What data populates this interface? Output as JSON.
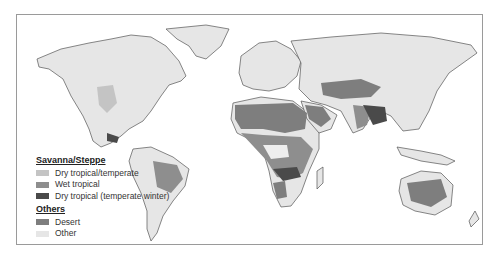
{
  "map": {
    "type": "World map of savanna/steppe vegetation zones (grayscale)"
  },
  "legend": {
    "group1_title": "Savanna/Steppe",
    "group1_items": [
      {
        "label": "Dry tropical/temperate",
        "color": "#c4c4c4"
      },
      {
        "label": "Wet tropical",
        "color": "#8e8e8e"
      },
      {
        "label": "Dry tropical (temperate winter)",
        "color": "#4a4a4a"
      }
    ],
    "group2_title": "Others",
    "group2_items": [
      {
        "label": "Desert",
        "color": "#7e7e7e"
      },
      {
        "label": "Other",
        "color": "#e6e6e6"
      }
    ]
  },
  "colors": {
    "other": "#e6e6e6",
    "dry_tropical_temperate": "#c4c4c4",
    "wet_tropical": "#8e8e8e",
    "dry_tropical_temperate_winter": "#4a4a4a",
    "desert": "#7e7e7e",
    "coast": "#555555"
  }
}
